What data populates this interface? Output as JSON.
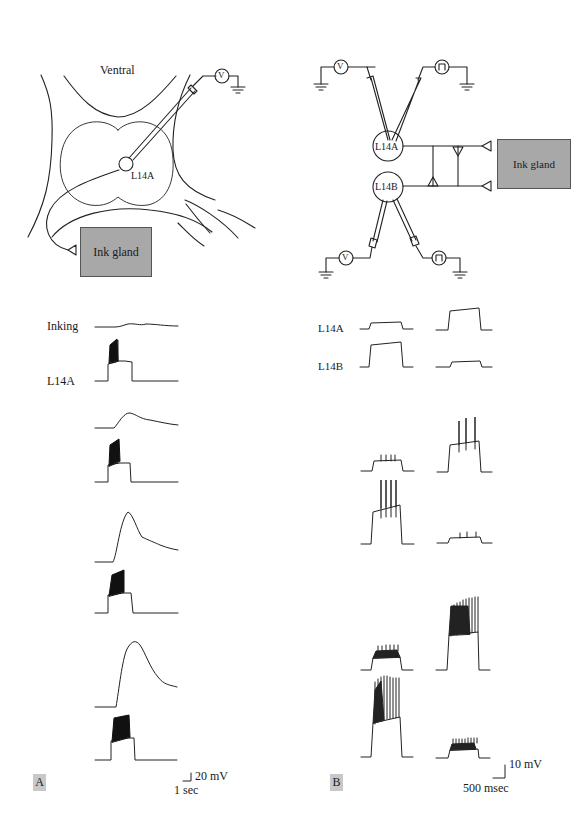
{
  "figure": {
    "panel_a": {
      "tag": "A",
      "diagram": {
        "title": "Ventral",
        "neuron_label": "L14A",
        "target_label": "Ink gland",
        "meter_symbol": "V"
      },
      "traces": {
        "row_labels": {
          "top": "Inking",
          "bottom": "L14A"
        },
        "rows": [
          {
            "inking_response": "small",
            "l14a_firing": "burst"
          },
          {
            "inking_response": "moderate",
            "l14a_firing": "burst"
          },
          {
            "inking_response": "large",
            "l14a_firing": "burst"
          },
          {
            "inking_response": "largest",
            "l14a_firing": "burst"
          }
        ]
      },
      "scale_bar": {
        "voltage": "20 mV",
        "time": "1 sec"
      }
    },
    "panel_b": {
      "tag": "B",
      "diagram": {
        "cell_a": "L14A",
        "cell_b": "L14B",
        "target_label": "Ink gland",
        "meter_symbol": "V",
        "stimulator_symbol": "pulse"
      },
      "traces": {
        "row_labels": {
          "a": "L14A",
          "b": "L14B"
        },
        "pairs": [
          {
            "stimulated": "L14B",
            "spikes_a": 0,
            "spikes_b": 0
          },
          {
            "stimulated": "L14A",
            "spikes_a": 0,
            "spikes_b": 0
          },
          {
            "stimulated": "L14B",
            "spikes_a": 4,
            "spikes_b": 4
          },
          {
            "stimulated": "L14A",
            "spikes_a": 3,
            "spikes_b": 3
          },
          {
            "stimulated": "L14B",
            "spikes_a": 9,
            "spikes_b": 10
          },
          {
            "stimulated": "L14A",
            "spikes_a": 12,
            "spikes_b": 10
          }
        ]
      },
      "scale_bar": {
        "voltage": "10 mV",
        "time": "500 msec"
      }
    }
  }
}
